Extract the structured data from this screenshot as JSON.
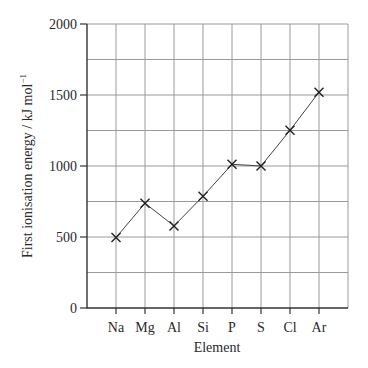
{
  "chart_data": {
    "type": "line",
    "title": "",
    "xlabel": "Element",
    "ylabel": "First ionisation energy / kJ mol",
    "ylabel_superscript": "−1",
    "categories": [
      "Na",
      "Mg",
      "Al",
      "Si",
      "P",
      "S",
      "Cl",
      "Ar"
    ],
    "series": [
      {
        "name": "First ionisation energy",
        "values": [
          496,
          738,
          578,
          787,
          1012,
          1000,
          1251,
          1520
        ],
        "marker": "x"
      }
    ],
    "ylim": [
      0,
      2000
    ],
    "yticks": [
      0,
      500,
      1000,
      1500,
      2000
    ],
    "ytick_labels": [
      "0",
      "500",
      "1000",
      "1500",
      "2000"
    ],
    "y_minor_gridlines": [
      250,
      750,
      1250,
      1750
    ],
    "grid": true,
    "legend": null
  },
  "colors": {
    "axis": "#333333",
    "grid": "#9a9a9a",
    "line": "#444444",
    "marker": "#222222",
    "text": "#2a2a2a"
  }
}
